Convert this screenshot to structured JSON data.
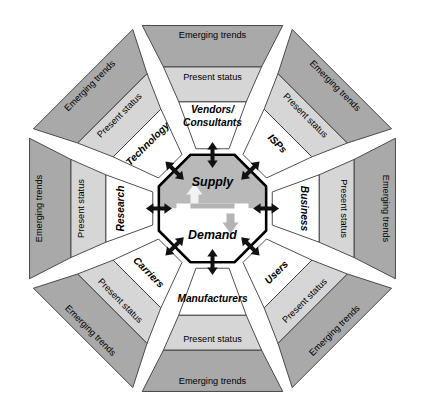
{
  "diagram": {
    "background_color": "#ffffff",
    "core": {
      "supply_label": "Supply",
      "demand_label": "Demand",
      "supply_fill": "#b9b9b9",
      "demand_fill": "#ffffff",
      "border_color": "#000000"
    },
    "band_labels": {
      "outer": "Emerging trends",
      "middle": "Present status"
    },
    "band_colors": {
      "outer": "#a9a9a9",
      "middle": "#d6d6d6",
      "inner": "#ffffff"
    },
    "arrow_color": "#111111",
    "sectors": [
      {
        "id": "vendors-consultants",
        "name": "Vendors/Consultants",
        "label_lines": [
          "Vendors/",
          "Consultants"
        ],
        "outer_band": "Emerging trends",
        "middle_band": "Present status",
        "angle_deg": 0,
        "position": "top"
      },
      {
        "id": "isps",
        "name": "ISPs",
        "label_lines": [
          "ISPs"
        ],
        "outer_band": "Emerging trends",
        "middle_band": "Present status",
        "angle_deg": 45,
        "position": "top-right"
      },
      {
        "id": "business",
        "name": "Business",
        "label_lines": [
          "Business"
        ],
        "outer_band": "Emerging trends",
        "middle_band": "Present status",
        "angle_deg": 90,
        "position": "right"
      },
      {
        "id": "users",
        "name": "Users",
        "label_lines": [
          "Users"
        ],
        "outer_band": "Emerging trends",
        "middle_band": "Present status",
        "angle_deg": 135,
        "position": "bottom-right"
      },
      {
        "id": "manufacturers",
        "name": "Manufacturers",
        "label_lines": [
          "Manufacturers"
        ],
        "outer_band": "Emerging trends",
        "middle_band": "Present status",
        "angle_deg": 180,
        "position": "bottom"
      },
      {
        "id": "carriers",
        "name": "Carriers",
        "label_lines": [
          "Carriers"
        ],
        "outer_band": "Emerging trends",
        "middle_band": "Present status",
        "angle_deg": 225,
        "position": "bottom-left"
      },
      {
        "id": "research",
        "name": "Research",
        "label_lines": [
          "Research"
        ],
        "outer_band": "Emerging trends",
        "middle_band": "Present status",
        "angle_deg": 270,
        "position": "left"
      },
      {
        "id": "technology",
        "name": "Technology",
        "label_lines": [
          "Technology"
        ],
        "outer_band": "Emerging trends",
        "middle_band": "Present status",
        "angle_deg": 315,
        "position": "top-left"
      }
    ]
  }
}
